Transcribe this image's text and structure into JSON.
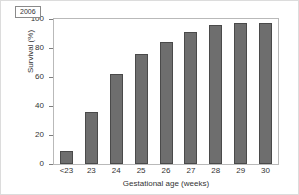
{
  "chart_data": {
    "type": "bar",
    "title": "",
    "subtitle": "",
    "xlabel": "Gestational age (weeks)",
    "ylabel": "Survival (%)",
    "categories": [
      "<23",
      "23",
      "24",
      "25",
      "26",
      "27",
      "28",
      "29",
      "30"
    ],
    "values": [
      9,
      36,
      62,
      76,
      84,
      91,
      96,
      97.5,
      97.5
    ],
    "series": [
      {
        "name": "2006",
        "values": [
          9,
          36,
          62,
          76,
          84,
          91,
          96,
          97.5,
          97.5
        ]
      }
    ],
    "ylim": [
      0,
      100
    ],
    "yticks": [
      0,
      20,
      40,
      60,
      80,
      100
    ],
    "ytick_labels": [
      "0",
      "20",
      "40",
      "60",
      "80",
      "100"
    ],
    "grid": false,
    "legend_position": "top-left",
    "legend_entries": [
      "2006"
    ],
    "annotations": [],
    "bar_color": "#6e6e6e",
    "bar_outline_color": "#4a4a4a",
    "axis_color": "#b9b9b9",
    "text_color": "#333333",
    "background_color": "#ffffff"
  },
  "legend": {
    "label": "2006"
  }
}
